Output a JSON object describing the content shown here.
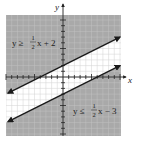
{
  "chart_data": {
    "type": "line",
    "title": "",
    "xlabel": "x",
    "ylabel": "y",
    "xlim": [
      -10,
      10
    ],
    "ylim": [
      -10,
      10
    ],
    "grid": true,
    "tick_step": 1,
    "series": [
      {
        "name": "upper boundary",
        "equation": "y = 1/2 x + 2",
        "slope": 0.5,
        "intercept": 2,
        "inequality": "y ≥ 1/2 x + 2",
        "shaded": "above",
        "label_parts": {
          "lhs": "y ≥",
          "num": "1",
          "den": "2",
          "rhs": "x + 2"
        }
      },
      {
        "name": "lower boundary",
        "equation": "y = 1/2 x - 3",
        "slope": 0.5,
        "intercept": -3,
        "inequality": "y ≤ 1/2 x − 3",
        "shaded": "below",
        "label_parts": {
          "lhs": "y ≤",
          "num": "1",
          "den": "2",
          "rhs": "x − 3"
        }
      }
    ]
  },
  "colors": {
    "shade": "#a9a9a9",
    "grid": "#c8c8c8",
    "axis": "#222222",
    "line": "#1a1a1a",
    "background": "#ffffff"
  },
  "axes": {
    "x_label": "x",
    "y_label": "y"
  }
}
